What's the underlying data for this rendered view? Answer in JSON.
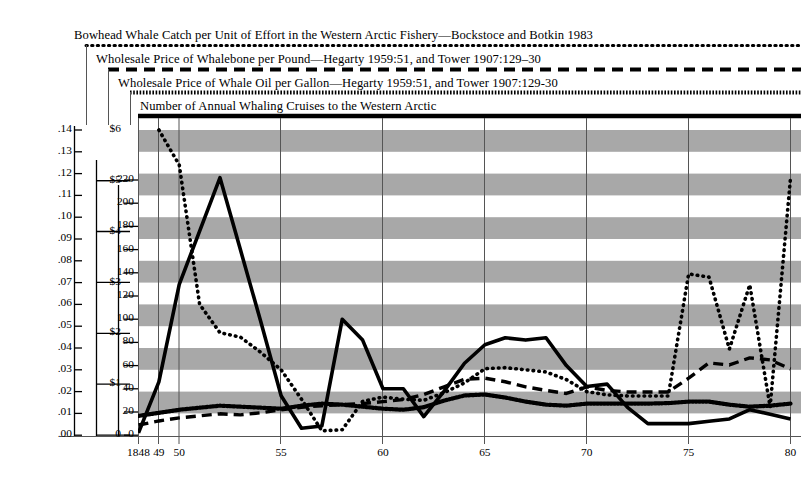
{
  "legend": {
    "entries": [
      {
        "label": "Bowhead Whale Catch per Unit of Effort in the Western Arctic Fishery—Bockstoce and Botkin 1983",
        "style": "dotted-fine",
        "series": "cpue"
      },
      {
        "label": "Wholesale Price of Whalebone per Pound—Hegarty 1959:51, and Tower 1907:129–30",
        "style": "dashed",
        "series": "whalebone"
      },
      {
        "label": "Wholesale Price of Whale Oil per Gallon—Hegarty 1959:51, and Tower 1907:129-30",
        "style": "dotted-dense",
        "series": "whaleoil"
      },
      {
        "label": "Number of Annual Whaling Cruises to the Western Arctic",
        "style": "solid",
        "series": "cruises"
      }
    ]
  },
  "axes": {
    "cpue_ticks": [
      ".00",
      ".01",
      ".02",
      ".03",
      ".04",
      ".05",
      ".06",
      ".07",
      ".08",
      ".09",
      ".10",
      ".11",
      ".12",
      ".13",
      ".14"
    ],
    "price_ticks": [
      "0",
      "$1",
      "$2",
      "$3",
      "$4",
      "$5",
      "$6"
    ],
    "cruise_ticks": [
      "0",
      "20",
      "40",
      "60",
      "80",
      "100",
      "120",
      "140",
      "160",
      "180",
      "200",
      "220"
    ],
    "x_ticks": [
      {
        "label": "1848",
        "year": 1848
      },
      {
        "label": "49",
        "year": 1849
      },
      {
        "label": "50",
        "year": 1850
      },
      {
        "label": "55",
        "year": 1855
      },
      {
        "label": "60",
        "year": 1860
      },
      {
        "label": "65",
        "year": 1865
      },
      {
        "label": "70",
        "year": 1870
      },
      {
        "label": "75",
        "year": 1875
      },
      {
        "label": "80",
        "year": 1880
      }
    ]
  },
  "chart_data": {
    "type": "line",
    "title": "Bowhead Whale Catch per Unit of Effort in the Western Arctic Fishery",
    "xlabel": "Year",
    "ylabel": "Catch per Unit of Effort / Price / Cruises",
    "grid": "horizontal-banded",
    "legend_position": "top",
    "x": [
      1848,
      1849,
      1850,
      1851,
      1852,
      1853,
      1854,
      1855,
      1856,
      1857,
      1858,
      1859,
      1860,
      1861,
      1862,
      1863,
      1864,
      1865,
      1866,
      1867,
      1868,
      1869,
      1870,
      1871,
      1872,
      1873,
      1874,
      1875,
      1876,
      1877,
      1878,
      1879,
      1880
    ],
    "axis_ranges": {
      "cpue": [
        0,
        0.14
      ],
      "price_dollars": [
        0,
        6
      ],
      "cruises": [
        0,
        220
      ]
    },
    "series": [
      {
        "name": "Bowhead Whale Catch per Unit of Effort",
        "key": "cpue",
        "axis": "cpue",
        "style": "dotted-fine",
        "values": [
          null,
          0.14,
          0.124,
          0.06,
          0.047,
          0.045,
          0.038,
          0.03,
          0.0165,
          0.002,
          0.0025,
          0.0155,
          0.0175,
          0.0165,
          0.016,
          0.0195,
          0.024,
          0.0305,
          0.031,
          0.03,
          0.029,
          0.0255,
          0.02,
          0.0185,
          0.018,
          0.018,
          0.018,
          0.074,
          0.0725,
          0.0395,
          0.069,
          0.013,
          0.118
        ]
      },
      {
        "name": "Wholesale Price of Whalebone per Pound",
        "key": "whalebone",
        "axis": "price_dollars",
        "style": "dashed",
        "values": [
          0.2,
          0.28,
          0.34,
          0.38,
          0.42,
          0.4,
          0.44,
          0.5,
          0.55,
          0.58,
          0.6,
          0.62,
          0.66,
          0.7,
          0.8,
          0.95,
          1.1,
          1.12,
          1.05,
          0.95,
          0.88,
          0.82,
          0.95,
          0.88,
          0.85,
          0.85,
          0.85,
          1.12,
          1.42,
          1.38,
          1.52,
          1.48,
          1.3
        ]
      },
      {
        "name": "Wholesale Price of Whale Oil per Gallon",
        "key": "whaleoil",
        "axis": "price_dollars",
        "style": "dotted-dense",
        "values": [
          0.38,
          0.44,
          0.5,
          0.54,
          0.58,
          0.56,
          0.54,
          0.52,
          0.58,
          0.62,
          0.6,
          0.56,
          0.52,
          0.5,
          0.55,
          0.68,
          0.78,
          0.8,
          0.74,
          0.66,
          0.6,
          0.58,
          0.62,
          0.62,
          0.62,
          0.62,
          0.63,
          0.66,
          0.66,
          0.6,
          0.56,
          0.58,
          0.62
        ]
      },
      {
        "name": "Number of Annual Whaling Cruises to the Western Arctic",
        "key": "cruises",
        "axis": "cruises",
        "style": "solid",
        "values": [
          2,
          46,
          130,
          176,
          222,
          160,
          98,
          34,
          6,
          8,
          100,
          82,
          40,
          40,
          16,
          38,
          62,
          78,
          84,
          82,
          84,
          60,
          42,
          44,
          24,
          10,
          10,
          10,
          12,
          14,
          22,
          18,
          14
        ]
      }
    ]
  }
}
